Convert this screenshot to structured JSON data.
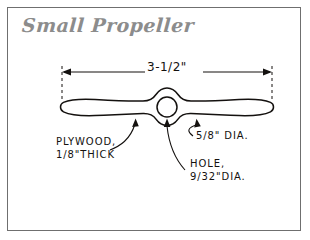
{
  "drawing": {
    "title": "Small Propeller",
    "title_color": "#8c8c8c",
    "border_color": "#6f6f6f",
    "ink_color": "#14110f",
    "background": "#ffffff"
  },
  "dimension": {
    "name": "overall-length",
    "value": "3-1/2\"",
    "arrow_left_x": 62,
    "arrow_right_x": 272,
    "line_y": 72
  },
  "annotations": [
    {
      "id": "plywood",
      "line1": "PLYWOOD,",
      "line2": "1/8\"THICK"
    },
    {
      "id": "hole",
      "line1": "HOLE,",
      "line2": "9/32\"DIA."
    },
    {
      "id": "boss",
      "line1": "5/8\" DIA.",
      "line2": ""
    }
  ],
  "part": {
    "shape": "two-blade-propeller",
    "hub_center_x": 167,
    "hub_center_y": 107,
    "hole_radius": 10,
    "blade_span_left": 60,
    "blade_span_right": 274
  }
}
